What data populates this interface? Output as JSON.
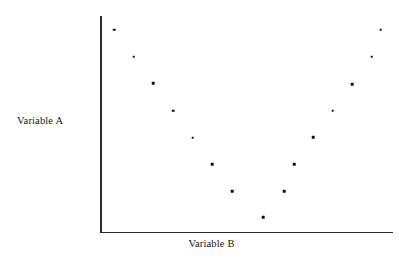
{
  "figure": {
    "kind": "scatter-plot",
    "background_color": "#ffffff",
    "axis_color": "#2b2b2b",
    "point_color": "#111111"
  },
  "labels": {
    "y_axis": "Variable A",
    "x_axis": "Variable B"
  },
  "chart_data": {
    "type": "scatter",
    "title": "",
    "xlabel": "Variable B",
    "ylabel": "Variable A",
    "grid": false,
    "legend": null,
    "xlim": [
      0,
      100
    ],
    "ylim": [
      0,
      100
    ],
    "axis_ticks": {
      "x": [],
      "y": []
    },
    "series": [
      {
        "name": "observations",
        "marker": "square-dot",
        "color": "#111111",
        "x": [
          4.8,
          11.5,
          18.2,
          24.9,
          31.6,
          38.3,
          45.0,
          55.7,
          62.7,
          69.4,
          76.0,
          79.3,
          86.0,
          92.6,
          95.9
        ],
        "y": [
          93.1,
          80.6,
          68.3,
          55.8,
          43.2,
          31.1,
          18.6,
          7.1,
          18.9,
          31.4,
          43.5,
          56.0,
          68.4,
          80.6,
          93.2
        ],
        "points": [
          {
            "px": 114.0,
            "py": 29.7
          },
          {
            "px": 133.7,
            "py": 56.7
          },
          {
            "px": 153.3,
            "py": 83.3
          },
          {
            "px": 173.0,
            "py": 110.7
          },
          {
            "px": 192.7,
            "py": 137.7
          },
          {
            "px": 212.3,
            "py": 164.0
          },
          {
            "px": 232.0,
            "py": 191.3
          },
          {
            "px": 263.3,
            "py": 217.3
          },
          {
            "px": 284.3,
            "py": 191.3
          },
          {
            "px": 294.3,
            "py": 164.0
          },
          {
            "px": 313.3,
            "py": 137.3
          },
          {
            "px": 332.7,
            "py": 110.7
          },
          {
            "px": 352.0,
            "py": 84.0
          },
          {
            "px": 371.5,
            "py": 56.7
          },
          {
            "px": 380.8,
            "py": 29.5
          }
        ]
      }
    ],
    "annotations": []
  }
}
